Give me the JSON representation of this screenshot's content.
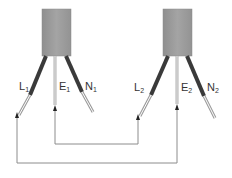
{
  "diagram": {
    "colors": {
      "box": "#9a9a9a",
      "box_edge": "#8a8a8a",
      "wire_dark": "#3a3a3a",
      "wire_light": "#b0b0b0",
      "loop": "#8c8c8c",
      "text": "#333333"
    },
    "devices": [
      {
        "id": "device-1",
        "wires": [
          {
            "letter": "L",
            "sub": "1"
          },
          {
            "letter": "E",
            "sub": "1"
          },
          {
            "letter": "N",
            "sub": "1"
          }
        ]
      },
      {
        "id": "device-2",
        "wires": [
          {
            "letter": "L",
            "sub": "2"
          },
          {
            "letter": "E",
            "sub": "2"
          },
          {
            "letter": "N",
            "sub": "2"
          }
        ]
      }
    ],
    "connections": [
      {
        "from": "E1",
        "to": "L2",
        "loop": "inner"
      },
      {
        "from": "L1",
        "to": "E2",
        "loop": "outer"
      }
    ]
  }
}
